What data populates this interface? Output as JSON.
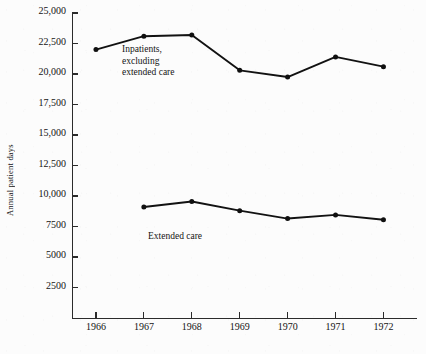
{
  "chart_data": {
    "type": "line",
    "title": "",
    "subtitle": "",
    "xlabel": "",
    "ylabel": "Annual patient days",
    "categories": [
      1966,
      1967,
      1968,
      1969,
      1970,
      1971,
      1972
    ],
    "xtick_labels": [
      "1966",
      "1967",
      "1968",
      "1969",
      "1970",
      "1971",
      "1972"
    ],
    "ytick_labels": [
      "2500",
      "5000",
      "7500",
      "10,000",
      "12,500",
      "15,000",
      "17,500",
      "20,000",
      "22,500",
      "25,000"
    ],
    "ytick_values": [
      2500,
      5000,
      7500,
      10000,
      12500,
      15000,
      17500,
      20000,
      22500,
      25000
    ],
    "ylim": [
      0,
      25000
    ],
    "xlim": [
      1965.5,
      1972.7
    ],
    "grid": false,
    "legend_position": "inline-annotation",
    "series": [
      {
        "name": "Inpatients, excluding extended care",
        "annotation": "Inpatients,\nexcluding\nextended care",
        "x": [
          1966,
          1967,
          1968,
          1969,
          1970,
          1971,
          1972
        ],
        "values": [
          22000,
          23100,
          23200,
          20300,
          19750,
          21400,
          20600
        ],
        "color": "#121212",
        "marker": "circle"
      },
      {
        "name": "Extended care",
        "annotation": "Extended care",
        "x": [
          1967,
          1968,
          1969,
          1970,
          1971,
          1972
        ],
        "values": [
          9100,
          9550,
          8800,
          8150,
          8450,
          8050
        ],
        "color": "#121212",
        "marker": "circle"
      }
    ]
  },
  "figure": {
    "background_color": "#fcfcfc",
    "axis_color": "#2b2b2b",
    "text_color": "#141414"
  }
}
